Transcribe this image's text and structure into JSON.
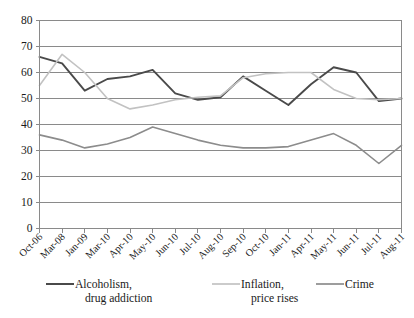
{
  "chart_data": {
    "type": "line",
    "title": "",
    "xlabel": "",
    "ylabel": "",
    "ylim": [
      0,
      80
    ],
    "ytick_step": 10,
    "yticks": [
      "0",
      "10",
      "20",
      "30",
      "40",
      "50",
      "60",
      "70",
      "80"
    ],
    "grid": "horizontal",
    "legend_position": "bottom",
    "categories": [
      "Oct-06",
      "Mar-08",
      "Jan-09",
      "Mar-10",
      "Apr-10",
      "May-10",
      "Jun-10",
      "Jul-10",
      "Aug-10",
      "Sep-10",
      "Oct-10",
      "Jan-11",
      "Apr-11",
      "May-11",
      "Jun-11",
      "Jul-11",
      "Aug-11"
    ],
    "series": [
      {
        "name": "Alcoholism, drug addiction",
        "color": "#4a4a4a",
        "values": [
          66,
          63.5,
          53,
          57.5,
          58.5,
          61,
          52,
          49.5,
          50.5,
          58.5,
          53,
          47.5,
          55.5,
          62,
          60,
          49,
          50
        ]
      },
      {
        "name": "Inflation, price rises",
        "color": "#c2c2c2",
        "values": [
          55,
          67,
          60,
          50,
          46,
          47.5,
          49.5,
          50.5,
          51,
          58,
          59.5,
          60,
          60,
          53.5,
          50,
          49.5,
          50
        ]
      },
      {
        "name": "Crime",
        "color": "#8c8c8c",
        "values": [
          36,
          34,
          31,
          32.5,
          35,
          39,
          36.5,
          34,
          32,
          31,
          31,
          31.5,
          34,
          36.5,
          32,
          25,
          32
        ]
      }
    ]
  },
  "legend": {
    "items": [
      {
        "label_line1": "Alcoholism,",
        "label_line2": "drug addiction",
        "color": "#4a4a4a"
      },
      {
        "label_line1": "Inflation,",
        "label_line2": "price rises",
        "color": "#c2c2c2"
      },
      {
        "label_line1": "Crime",
        "label_line2": "",
        "color": "#8c8c8c"
      }
    ]
  },
  "axis": {
    "frame_color": "#8a8a8a",
    "grid_color": "#8a8a8a"
  }
}
